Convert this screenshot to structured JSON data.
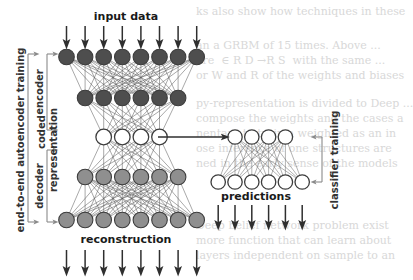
{
  "figure": {
    "labels": {
      "input_data": "input data",
      "encoder": "encoder",
      "coded_representation_line1": "coded",
      "coded_representation_line2": "representation",
      "decoder": "decoder",
      "reconstruction": "reconstruction",
      "end_to_end": "end-to-end autoencoder training",
      "predictions": "predictions",
      "classifier_training": "classifier training"
    },
    "colors": {
      "node_dark": "#4e4e4e",
      "node_mid": "#8f8f8f",
      "node_white": "#ffffff",
      "node_stroke": "#3c3c3c",
      "edge": "#5a5a5a",
      "arrow": "#3a3a3a",
      "bracket": "#8a8a8a",
      "text": "#1a1a1a",
      "background": "#ffffff",
      "ghost_text": "#d8d8d8"
    },
    "autoencoder": {
      "layers": [
        {
          "name": "input-layer",
          "count": 8,
          "fill": "node_dark",
          "cy": 57,
          "spacing": 18.6,
          "cx0": 66.5,
          "r": 7.8
        },
        {
          "name": "encoder-hidden",
          "count": 6,
          "fill": "node_dark",
          "cy": 98,
          "spacing": 18.6,
          "cx0": 85.1,
          "r": 7.8
        },
        {
          "name": "code-layer",
          "count": 4,
          "fill": "node_white",
          "cy": 137,
          "spacing": 18.6,
          "cx0": 103.7,
          "r": 7.8
        },
        {
          "name": "decoder-hidden",
          "count": 6,
          "fill": "node_mid",
          "cy": 177,
          "spacing": 18.6,
          "cx0": 85.1,
          "r": 7.8
        },
        {
          "name": "output-layer",
          "count": 8,
          "fill": "node_mid",
          "cy": 220,
          "spacing": 18.6,
          "cx0": 66.5,
          "r": 7.8
        }
      ],
      "input_arrows": {
        "count": 8,
        "x0": 66.5,
        "spacing": 18.6,
        "y_top": 26,
        "y_bottom": 45
      },
      "output_arrows": {
        "count": 8,
        "x0": 66.5,
        "spacing": 18.6,
        "y_top": 250,
        "y_bottom": 272
      }
    },
    "classifier": {
      "layers": [
        {
          "name": "classifier-hidden",
          "count": 4,
          "fill": "node_white",
          "cy": 137,
          "spacing": 16.8,
          "cx0": 235.0,
          "r": 7.2
        },
        {
          "name": "prediction-layer",
          "count": 6,
          "fill": "node_white",
          "cy": 182,
          "spacing": 16.8,
          "cx0": 218.2,
          "r": 7.2
        }
      ],
      "output_arrows": {
        "count": 6,
        "x0": 218.2,
        "spacing": 16.8,
        "y_top": 205,
        "y_bottom": 226
      }
    },
    "transfer_arrow": {
      "x1": 158,
      "x2": 226,
      "y": 137
    },
    "brackets": {
      "end_to_end": {
        "x": 28,
        "y_top": 54,
        "y_bottom": 222
      },
      "encoder": {
        "x": 47,
        "y_top": 54,
        "y_bottom": 130
      },
      "decoder": {
        "x": 47,
        "y_top": 150,
        "y_bottom": 222
      },
      "classifier_training": {
        "x": 322,
        "y_top": 137,
        "y_bottom": 182
      }
    }
  },
  "page_background_text": {
    "lines": [
      {
        "x": 196,
        "y": 4,
        "text": "ks also show how techniques in these"
      },
      {
        "x": 196,
        "y": 38,
        "text": "an a GRBM of 15 times. Above ..."
      },
      {
        "x": 196,
        "y": 53,
        "text": "are  ∈ R D →R S  with the same ..."
      },
      {
        "x": 196,
        "y": 68,
        "text": "or W and R of the weights and biases"
      },
      {
        "x": 196,
        "y": 96,
        "text": "py-representation is divided to Deep ..."
      },
      {
        "x": 196,
        "y": 111,
        "text": "compose the weights and the cases a"
      },
      {
        "x": 196,
        "y": 126,
        "text": "nentary to train a weighted as an in"
      },
      {
        "x": 196,
        "y": 141,
        "text": "ose inference of one structures are"
      },
      {
        "x": 196,
        "y": 156,
        "text": "ned in the early sense of the models"
      },
      {
        "x": 196,
        "y": 218,
        "text": "Deep belief network problem exist"
      },
      {
        "x": 196,
        "y": 233,
        "text": "more function that can learn about"
      },
      {
        "x": 196,
        "y": 248,
        "text": "layers independent on sample to an"
      }
    ]
  }
}
